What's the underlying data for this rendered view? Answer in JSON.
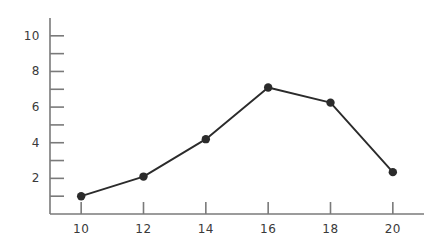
{
  "chart_data": {
    "type": "line",
    "title": "",
    "subtitle": "",
    "xlabel": "",
    "ylabel": "",
    "x": [
      10,
      12,
      14,
      16,
      18,
      20
    ],
    "values": [
      1.0,
      2.1,
      4.2,
      7.1,
      6.25,
      2.35
    ],
    "series": [
      {
        "name": "",
        "x": [
          10,
          12,
          14,
          16,
          18,
          20
        ],
        "values": [
          1.0,
          2.1,
          4.2,
          7.1,
          6.25,
          2.35
        ]
      }
    ],
    "xlim": [
      9.0,
      21.0
    ],
    "ylim": [
      0.0,
      11.0
    ],
    "xticks": [
      10,
      12,
      14,
      16,
      18,
      20
    ],
    "xtick_labels": [
      "10",
      "12",
      "14",
      "16",
      "18",
      "20"
    ],
    "yticks": [
      1,
      2,
      3,
      4,
      5,
      6,
      7,
      8,
      9,
      10
    ],
    "ytick_labels_shown": [
      "2",
      "4",
      "6",
      "8",
      "10"
    ],
    "ytick_labels": [
      "",
      "2",
      "",
      "4",
      "",
      "6",
      "",
      "8",
      "",
      "10"
    ],
    "grid": false,
    "legend": "none",
    "annotations": [],
    "line_color": "#2b2b2b",
    "marker_color": "#2b2b2b",
    "marker": "circle",
    "axis_color": "#7a7a7a",
    "background_color": "#ffffff",
    "tick_label_color": "#3a3a3a"
  },
  "axes": {
    "y_axis_name": "y-axis",
    "x_axis_name": "x-axis"
  }
}
